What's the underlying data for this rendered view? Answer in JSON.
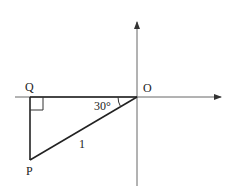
{
  "diagram": {
    "type": "right-triangle-on-axes",
    "labels": {
      "origin": "O",
      "q": "Q",
      "p": "P",
      "angle": "30°",
      "hypotenuse": "1"
    },
    "angle_degrees": 30,
    "hypotenuse_length": 1,
    "right_angle_at": "Q",
    "colors": {
      "stroke": "#222222",
      "axis": "#666666",
      "background": "#ffffff"
    }
  }
}
